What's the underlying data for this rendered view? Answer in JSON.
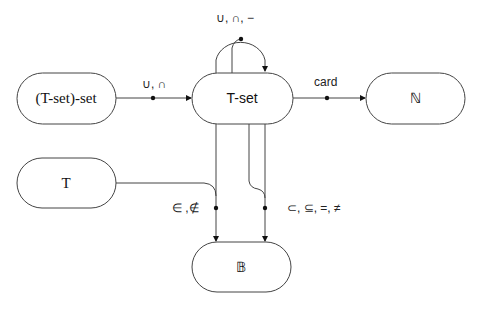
{
  "nodes": {
    "tset_set": {
      "label": "(T-set)-set"
    },
    "tset": {
      "label": "T-set"
    },
    "nat": {
      "label": "ℕ"
    },
    "t": {
      "label": "T"
    },
    "bool": {
      "label": "𝔹"
    }
  },
  "edges": {
    "union_intersect": {
      "label": "∪, ∩"
    },
    "self_ops": {
      "label": "∪, ∩, −"
    },
    "card": {
      "label": "card"
    },
    "membership": {
      "label": "∈ ,∉"
    },
    "comparison": {
      "label": "⊂, ⊆, =, ≠"
    }
  },
  "colors": {
    "stroke": "#444444",
    "background": "#ffffff"
  }
}
